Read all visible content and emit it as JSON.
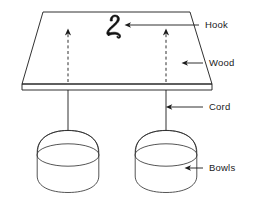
{
  "figure": {
    "background_color": "#ffffff",
    "ink_color": "#1a1a1a",
    "width": 259,
    "height": 199
  },
  "labels": [
    {
      "id": "hook",
      "text": "Hook",
      "x": 203,
      "y": 28,
      "leader_from_x": 199,
      "leader_from_y": 25,
      "leader_to_x": 129,
      "leader_to_y": 25,
      "arrow": true
    },
    {
      "id": "wood",
      "text": "Wood",
      "x": 207,
      "y": 66,
      "leader_from_x": 203,
      "leader_from_y": 63,
      "leader_to_x": 184,
      "leader_to_y": 63,
      "arrow": true
    },
    {
      "id": "cord",
      "text": "Cord",
      "x": 207,
      "y": 110,
      "leader_from_x": 203,
      "leader_from_y": 107,
      "leader_to_x": 166,
      "leader_to_y": 107,
      "arrow": true
    },
    {
      "id": "bowls",
      "text": "Bowls",
      "x": 207,
      "y": 171,
      "leader_from_x": 203,
      "leader_from_y": 168,
      "leader_to_x": 186,
      "leader_to_y": 168,
      "arrow": true
    }
  ],
  "board": {
    "name": "wooden-board",
    "top_face": "M 43,12 L 190,12 L 212,84 L 22,84 Z",
    "thickness_front": "M 22,84 L 212,84 L 212,90 L 22,90 Z",
    "front_edge_line": "M 22,90 L 212,90"
  },
  "hook_symbol": {
    "name": "hook-glyph",
    "description": "hand-drawn hook resembling a cursive 2",
    "x": 112,
    "y": 22
  },
  "force_arrows": [
    {
      "id": "left-force-arrow",
      "x": 68,
      "y_bottom": 82,
      "y_top": 33,
      "style": "dashed",
      "direction": "up"
    },
    {
      "id": "right-force-arrow",
      "x": 166,
      "y_bottom": 82,
      "y_top": 33,
      "style": "dashed",
      "direction": "up"
    }
  ],
  "cords": [
    {
      "id": "left-cord",
      "x": 68,
      "y_top": 90,
      "y_bottom": 131
    },
    {
      "id": "right-cord",
      "x": 166,
      "y_top": 90,
      "y_bottom": 131
    }
  ],
  "bowls": [
    {
      "id": "left-bowl",
      "cx": 68,
      "rim_cy": 155,
      "rim_rx": 31,
      "rim_ry": 11,
      "body_top_y": 131,
      "body_bottom_y": 192
    },
    {
      "id": "right-bowl",
      "cx": 166,
      "rim_cy": 155,
      "rim_rx": 31,
      "rim_ry": 11,
      "body_top_y": 131,
      "body_bottom_y": 192
    }
  ]
}
